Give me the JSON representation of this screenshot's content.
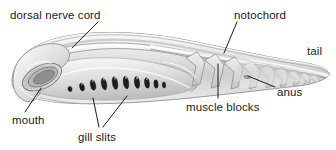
{
  "diagram": {
    "title": "",
    "background_color": "#ffffff",
    "label_color": "#1b1b1b",
    "body_fill_light": "#f4f4f4",
    "body_fill_mid": "#d6d6d6",
    "body_fill_dark": "#a8a8a8",
    "outline_color": "#7d7d7d",
    "gill_slit_color": "#1f1f1f",
    "leader_line_color": "#1b1b1b"
  },
  "labels": [
    {
      "id": "dorsal-nerve-cord",
      "text": "dorsal nerve cord",
      "x": 10,
      "y": 9,
      "anchor": "left"
    },
    {
      "id": "notochord",
      "text": "notochord",
      "x": 234,
      "y": 9,
      "anchor": "left"
    },
    {
      "id": "tail",
      "text": "tail",
      "x": 307,
      "y": 45,
      "anchor": "left"
    },
    {
      "id": "anus",
      "text": "anus",
      "x": 277,
      "y": 86,
      "anchor": "left"
    },
    {
      "id": "muscle-blocks",
      "text": "muscle blocks",
      "x": 186,
      "y": 101,
      "anchor": "left"
    },
    {
      "id": "gill-slits",
      "text": "gill slits",
      "x": 78,
      "y": 131,
      "anchor": "left"
    },
    {
      "id": "mouth",
      "text": "mouth",
      "x": 12,
      "y": 114,
      "anchor": "left"
    }
  ],
  "leaders": [
    {
      "id": "leader-dorsal-nerve-cord",
      "from": [
        98,
        22
      ],
      "to": [
        72,
        48
      ]
    },
    {
      "id": "leader-notochord",
      "from": [
        237,
        22
      ],
      "to": [
        224,
        53
      ]
    },
    {
      "id": "leader-anus",
      "from": [
        275,
        87
      ],
      "to": [
        248,
        76
      ]
    },
    {
      "id": "leader-muscle-blocks",
      "from": [
        218,
        98
      ],
      "to": [
        218,
        64
      ]
    },
    {
      "id": "leader-gill-slits-a",
      "from": [
        99,
        127
      ],
      "to": [
        93,
        98
      ]
    },
    {
      "id": "leader-gill-slits-b",
      "from": [
        103,
        127
      ],
      "to": [
        127,
        96
      ]
    },
    {
      "id": "leader-mouth",
      "from": [
        25,
        112
      ],
      "to": [
        41,
        88
      ]
    }
  ],
  "anatomy_parts": [
    {
      "id": "body",
      "name": "body-outline"
    },
    {
      "id": "dorsal-fin-ridge",
      "name": "dorsal-fin-ridge"
    },
    {
      "id": "nerve-cord-groove",
      "name": "dorsal-nerve-cord-groove"
    },
    {
      "id": "notochord-band",
      "name": "notochord-band"
    },
    {
      "id": "oral-hood",
      "name": "oral-hood-mouth"
    },
    {
      "id": "pharynx",
      "name": "pharynx-region"
    },
    {
      "id": "muscle-segments",
      "name": "muscle-blocks-chevrons"
    },
    {
      "id": "tail-fin",
      "name": "caudal-tail-fin"
    },
    {
      "id": "anus-opening",
      "name": "anus-opening"
    }
  ],
  "gill_slits": {
    "count": 10,
    "name": "gill-slit"
  }
}
